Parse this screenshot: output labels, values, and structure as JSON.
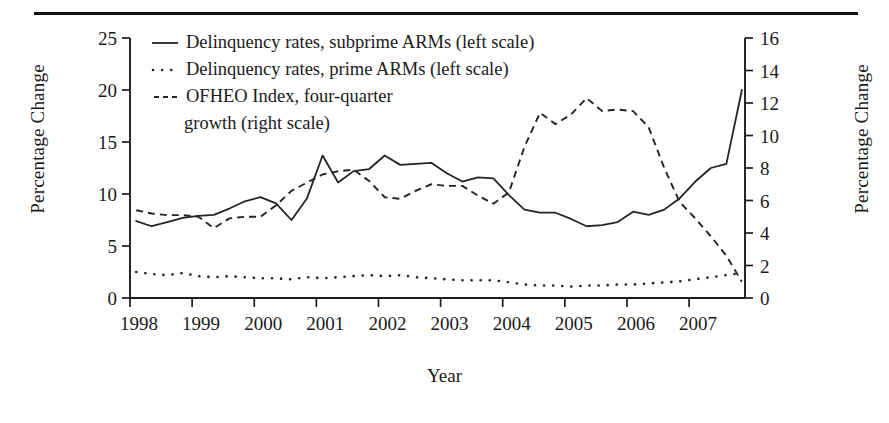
{
  "figure": {
    "top_rule": "horizontal-rule",
    "xlabel": "Year",
    "ylabel_left": "Percentage Change",
    "ylabel_right": "Percentage Change"
  },
  "legend": {
    "items": [
      {
        "style": "solid",
        "label": "Delinquency rates, subprime ARMs (left scale)"
      },
      {
        "style": "dotted",
        "label": "Delinquency rates, prime ARMs (left scale)"
      },
      {
        "style": "dashed",
        "label": "OFHEO Index, four-quarter"
      },
      {
        "style": "none",
        "label": "growth (right scale)"
      }
    ]
  },
  "chart_data": {
    "type": "line",
    "title": "",
    "xlabel": "Year",
    "ylabel": "Percentage Change",
    "ylabel_right": "Percentage Change",
    "grid": false,
    "legend_position": "top-left-inside",
    "xlim": [
      1998.0,
      2007.9
    ],
    "xticks": [
      1998,
      1999,
      2000,
      2001,
      2002,
      2003,
      2004,
      2005,
      2006,
      2007
    ],
    "xtick_labels": [
      "1998",
      "1999",
      "2000",
      "2001",
      "2002",
      "2003",
      "2004",
      "2005",
      "2006",
      "2007"
    ],
    "ylim_left": [
      0,
      25
    ],
    "yticks_left": [
      0,
      5,
      10,
      15,
      20,
      25
    ],
    "ytick_labels_left": [
      "0",
      "5",
      "10",
      "15",
      "20",
      "25"
    ],
    "ylim_right": [
      0,
      16
    ],
    "yticks_right": [
      0,
      2,
      4,
      6,
      8,
      10,
      12,
      14,
      16
    ],
    "ytick_labels_right": [
      "0",
      "2",
      "4",
      "6",
      "8",
      "10",
      "12",
      "14",
      "16"
    ],
    "x": [
      1998.1,
      1998.35,
      1998.6,
      1998.85,
      1999.1,
      1999.35,
      1999.6,
      1999.85,
      2000.1,
      2000.35,
      2000.6,
      2000.85,
      2001.1,
      2001.35,
      2001.6,
      2001.85,
      2002.1,
      2002.35,
      2002.6,
      2002.85,
      2003.1,
      2003.35,
      2003.6,
      2003.85,
      2004.1,
      2004.35,
      2004.6,
      2004.85,
      2005.1,
      2005.35,
      2005.6,
      2005.85,
      2006.1,
      2006.35,
      2006.6,
      2006.85,
      2007.1,
      2007.35,
      2007.6,
      2007.85
    ],
    "series": [
      {
        "name": "Delinquency rates, subprime ARMs (left scale)",
        "scale": "left",
        "style": "solid",
        "units": "percent",
        "values": [
          7.4,
          6.9,
          7.3,
          7.7,
          7.9,
          8.0,
          8.6,
          9.3,
          9.7,
          9.1,
          7.5,
          9.6,
          13.7,
          11.1,
          12.2,
          12.4,
          13.7,
          12.8,
          12.9,
          13.0,
          12.0,
          11.2,
          11.6,
          11.5,
          9.9,
          8.5,
          8.2,
          8.2,
          7.6,
          6.9,
          7.0,
          7.3,
          8.3,
          8.0,
          8.5,
          9.6,
          11.2,
          12.5,
          12.9,
          20.0
        ]
      },
      {
        "name": "Delinquency rates, prime ARMs (left scale)",
        "scale": "left",
        "style": "dotted",
        "units": "percent",
        "values": [
          2.5,
          2.3,
          2.2,
          2.4,
          2.1,
          2.0,
          2.1,
          2.0,
          1.9,
          1.9,
          1.8,
          2.0,
          1.9,
          2.0,
          2.1,
          2.2,
          2.1,
          2.2,
          2.0,
          1.9,
          1.8,
          1.7,
          1.7,
          1.7,
          1.5,
          1.3,
          1.2,
          1.2,
          1.1,
          1.2,
          1.2,
          1.3,
          1.3,
          1.4,
          1.5,
          1.6,
          1.8,
          2.0,
          2.2,
          2.4
        ]
      },
      {
        "name": "OFHEO Index, four-quarter growth (right scale)",
        "scale": "right",
        "style": "dashed",
        "units": "percent",
        "values": [
          5.4,
          5.2,
          5.1,
          5.1,
          5.0,
          4.3,
          4.9,
          5.0,
          5.0,
          5.7,
          6.6,
          7.1,
          7.6,
          7.8,
          7.9,
          7.2,
          6.2,
          6.1,
          6.6,
          7.0,
          6.9,
          6.9,
          6.3,
          5.8,
          6.5,
          9.3,
          11.4,
          10.7,
          11.3,
          12.3,
          11.5,
          11.6,
          11.5,
          10.5,
          8.0,
          5.9,
          4.9,
          3.8,
          2.6,
          1.0
        ]
      }
    ]
  }
}
